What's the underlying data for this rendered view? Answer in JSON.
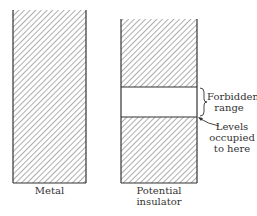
{
  "diagram": {
    "type": "energy-band-comparison",
    "panels": [
      {
        "id": "metal",
        "label": "Metal",
        "bands": [
          {
            "kind": "occupied",
            "top": 10,
            "bottom": 183
          }
        ]
      },
      {
        "id": "insulator",
        "label_line1": "Potential",
        "label_line2": "insulator",
        "bands": [
          {
            "kind": "occupied",
            "top": 19,
            "bottom": 87
          },
          {
            "kind": "forbidden",
            "top": 87,
            "bottom": 117
          },
          {
            "kind": "occupied",
            "top": 117,
            "bottom": 183
          }
        ]
      }
    ],
    "annotations": {
      "forbidden_line1": "Forbidden",
      "forbidden_line2": "range",
      "levels_line1": "Levels",
      "levels_line2": "occupied",
      "levels_line3": "to here"
    },
    "colors": {
      "line": "#333333",
      "hatch": "#666666",
      "background": "#ffffff"
    }
  }
}
